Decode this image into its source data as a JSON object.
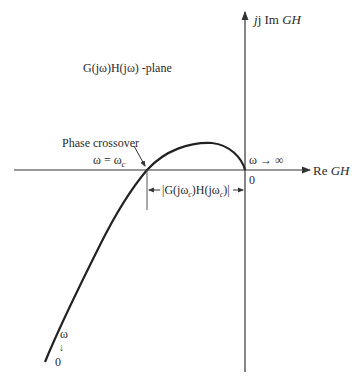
{
  "title": "G(jω)H(jω) -plane",
  "axes": {
    "imag_label_prefix": "j Im ",
    "imag_label_var": "GH",
    "real_label_prefix": "Re ",
    "real_label_var": "GH",
    "origin_label": "0"
  },
  "annotations": {
    "phase_crossover": "Phase crossover",
    "omega_c": "ω = ω",
    "omega_c_sub": "c",
    "omega_inf": "ω → ∞",
    "magnitude": "|G(jω",
    "magnitude_sub1": "c",
    "magnitude_mid": ")H(jω",
    "magnitude_sub2": "c",
    "magnitude_end": ")|",
    "omega_start": "ω",
    "omega_start_arrow": "↓",
    "omega_zero": "0"
  },
  "colors": {
    "curve": "#222222",
    "axis": "#333333",
    "text": "#2a2a2a"
  }
}
